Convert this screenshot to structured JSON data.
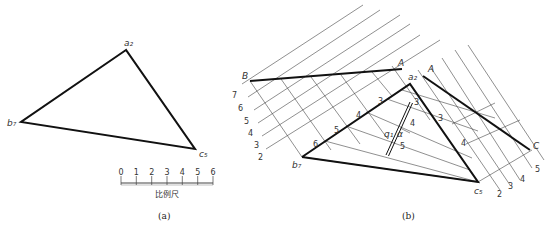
{
  "figure_a": {
    "caption": "(a)",
    "vertices": {
      "a": "a₂",
      "b": "b₇",
      "c": "c₅"
    },
    "scale_bar": {
      "label": "比例尺",
      "ticks": [
        "0",
        "1",
        "2",
        "3",
        "4",
        "5",
        "6"
      ]
    }
  },
  "figure_b": {
    "caption": "(b)",
    "points": {
      "B": "B",
      "A1": "A",
      "A2": "A",
      "a2": "a₂",
      "b1": "b₇",
      "c5": "c₅",
      "C": "C"
    },
    "left_scale": [
      "7",
      "6",
      "5",
      "4",
      "3",
      "2"
    ],
    "right_scale": [
      "2",
      "3",
      "4",
      "5"
    ],
    "edge_marks_ab": [
      "6",
      "5",
      "4",
      "3"
    ],
    "edge_marks_ac": [
      "3",
      "4"
    ],
    "line_q": {
      "label": "q₁",
      "angle": "α",
      "marks": [
        "3",
        "4",
        "5"
      ]
    }
  }
}
